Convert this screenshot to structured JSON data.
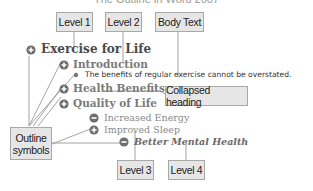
{
  "title": "The Outline in Word 2007",
  "callouts": {
    "level1": "Level 1",
    "level2": "Level 2",
    "body_text": "Body Text",
    "collapsed_heading": "Collapsed heading",
    "outline_symbols_line1": "Outline",
    "outline_symbols_line2": "symbols",
    "level3": "Level 3",
    "level4": "Level 4"
  },
  "outline": {
    "h1": "Exercise for Life",
    "h2_intro": "Introduction",
    "body": "The benefits of regular exercise cannot be overstated.",
    "h2_health": "Health Benefits",
    "h2_quality": "Quality of Life",
    "h3_energy": "Increased Energy",
    "h3_sleep": "Improved Sleep",
    "h4_mental": "Better Mental Health"
  },
  "symbols": {
    "plus": "expand-plus-icon",
    "minus": "collapse-minus-icon",
    "bullet": "body-text-bullet-icon"
  },
  "colors": {
    "callout_bg": "#e6e6e6",
    "callout_border": "#a8a8a8",
    "line": "#8c8c8c",
    "symbol": "#6e6e6e"
  }
}
